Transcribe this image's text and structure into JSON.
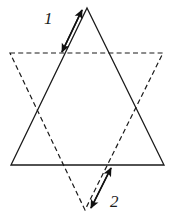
{
  "figure": {
    "canvas": {
      "width": 172,
      "height": 220
    },
    "background_color": "#ffffff",
    "stroke_color": "#1a1a1a",
    "shapes": [
      {
        "name": "upward-triangle",
        "style": "solid",
        "points": "87,8 164,165 11,165",
        "vertices": [
          [
            87,
            8
          ],
          [
            164,
            165
          ],
          [
            11,
            165
          ]
        ]
      },
      {
        "name": "downward-triangle",
        "style": "dashed",
        "points": "10,53 163,53 85,210",
        "vertices": [
          [
            10,
            53
          ],
          [
            163,
            53
          ],
          [
            85,
            210
          ]
        ]
      }
    ],
    "arrows": [
      {
        "name": "arrow-1",
        "label": "1",
        "double_headed": true,
        "from": [
          82,
          10
        ],
        "to": [
          62,
          52
        ],
        "parallel_to": "upward-triangle-left-edge"
      },
      {
        "name": "arrow-2",
        "label": "2",
        "double_headed": true,
        "from": [
          91,
          208
        ],
        "to": [
          111,
          168
        ],
        "parallel_to": "downward-triangle-right-edge"
      }
    ],
    "labels": [
      {
        "name": "label-1",
        "text": "1",
        "x": 44,
        "y": 10
      },
      {
        "name": "label-2",
        "text": "2",
        "x": 110,
        "y": 193
      }
    ]
  }
}
